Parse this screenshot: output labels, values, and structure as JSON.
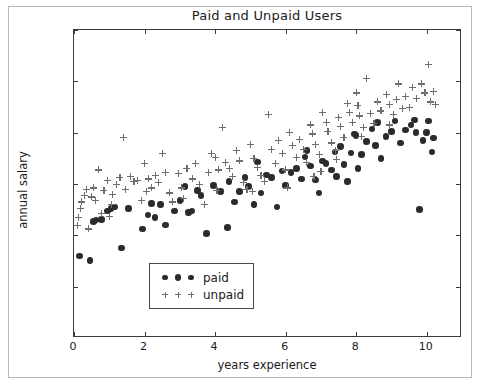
{
  "chart_data": {
    "type": "scatter",
    "title": "Paid and Unpaid Users",
    "xlabel": "years experience",
    "ylabel": "annual salary",
    "xlim": [
      0,
      11
    ],
    "ylim": [
      0,
      120000
    ],
    "xticks": [
      0,
      2,
      4,
      6,
      8,
      10
    ],
    "xtick_labels": [
      "0",
      "2",
      "4",
      "6",
      "8",
      "10"
    ],
    "yticks": [
      0,
      20000,
      40000,
      60000,
      80000,
      100000,
      120000
    ],
    "ytick_labels": [
      "0",
      "20000",
      "40000",
      "60000",
      "80000",
      "100000",
      "120000"
    ],
    "grid": false,
    "legend_position": "lower center",
    "colors": {
      "paid": "#2b2b2b",
      "unpaid": "#6e6e6e",
      "axis": "#3b3b3b",
      "background": "#ffffff",
      "frame": "#b9b9b9"
    },
    "series": [
      {
        "name": "paid",
        "marker": "circle",
        "color": "#2b2b2b",
        "points": [
          [
            0.15,
            32000
          ],
          [
            0.45,
            30200
          ],
          [
            0.55,
            45500
          ],
          [
            0.62,
            46000
          ],
          [
            0.78,
            46200
          ],
          [
            0.95,
            49500
          ],
          [
            1.05,
            50500
          ],
          [
            1.15,
            51000
          ],
          [
            1.35,
            35000
          ],
          [
            1.55,
            50500
          ],
          [
            1.95,
            42500
          ],
          [
            2.1,
            48000
          ],
          [
            2.3,
            47000
          ],
          [
            2.45,
            52000
          ],
          [
            2.6,
            44000
          ],
          [
            2.85,
            49500
          ],
          [
            3.0,
            53500
          ],
          [
            3.25,
            49000
          ],
          [
            3.35,
            49500
          ],
          [
            3.5,
            57500
          ],
          [
            3.6,
            55500
          ],
          [
            3.75,
            40800
          ],
          [
            3.95,
            59500
          ],
          [
            4.15,
            57000
          ],
          [
            4.35,
            43000
          ],
          [
            4.55,
            53000
          ],
          [
            4.7,
            57000
          ],
          [
            4.85,
            62500
          ],
          [
            4.95,
            59000
          ],
          [
            5.1,
            52000
          ],
          [
            5.3,
            56500
          ],
          [
            5.45,
            63500
          ],
          [
            5.6,
            62500
          ],
          [
            5.75,
            51000
          ],
          [
            5.9,
            65000
          ],
          [
            6.0,
            59500
          ],
          [
            6.15,
            64500
          ],
          [
            6.3,
            66000
          ],
          [
            6.45,
            62000
          ],
          [
            6.55,
            70500
          ],
          [
            6.7,
            67000
          ],
          [
            6.85,
            61500
          ],
          [
            6.95,
            56500
          ],
          [
            7.05,
            69000
          ],
          [
            7.15,
            68000
          ],
          [
            7.3,
            65500
          ],
          [
            7.45,
            63000
          ],
          [
            7.55,
            74500
          ],
          [
            7.65,
            67500
          ],
          [
            7.75,
            61000
          ],
          [
            7.85,
            72000
          ],
          [
            7.95,
            79500
          ],
          [
            8.0,
            79000
          ],
          [
            8.05,
            66000
          ],
          [
            8.15,
            71500
          ],
          [
            8.3,
            76500
          ],
          [
            8.45,
            81500
          ],
          [
            8.55,
            75000
          ],
          [
            8.7,
            70000
          ],
          [
            8.85,
            78500
          ],
          [
            9.0,
            80500
          ],
          [
            9.1,
            84500
          ],
          [
            9.25,
            76000
          ],
          [
            9.4,
            81000
          ],
          [
            9.55,
            83000
          ],
          [
            9.65,
            85000
          ],
          [
            9.8,
            50000
          ],
          [
            9.9,
            77000
          ],
          [
            10.0,
            80000
          ],
          [
            10.05,
            84500
          ],
          [
            10.15,
            72500
          ],
          [
            10.2,
            78000
          ],
          [
            5.2,
            68500
          ],
          [
            6.6,
            73000
          ],
          [
            7.4,
            72500
          ],
          [
            8.6,
            84000
          ],
          [
            9.7,
            80000
          ],
          [
            4.4,
            61000
          ],
          [
            3.15,
            59000
          ],
          [
            2.2,
            52500
          ]
        ]
      },
      {
        "name": "unpaid",
        "marker": "plus",
        "color": "#6e6e6e",
        "points": [
          [
            0.1,
            44000
          ],
          [
            0.12,
            47000
          ],
          [
            0.18,
            50500
          ],
          [
            0.22,
            53000
          ],
          [
            0.3,
            55500
          ],
          [
            0.35,
            58000
          ],
          [
            0.4,
            42500
          ],
          [
            0.5,
            55000
          ],
          [
            0.55,
            58500
          ],
          [
            0.6,
            53500
          ],
          [
            0.7,
            65500
          ],
          [
            0.78,
            48500
          ],
          [
            0.85,
            57500
          ],
          [
            0.95,
            61500
          ],
          [
            1.0,
            47500
          ],
          [
            1.1,
            56000
          ],
          [
            1.2,
            60000
          ],
          [
            1.3,
            62500
          ],
          [
            1.4,
            78000
          ],
          [
            1.45,
            58000
          ],
          [
            1.6,
            63000
          ],
          [
            1.7,
            61000
          ],
          [
            1.8,
            61500
          ],
          [
            1.9,
            53500
          ],
          [
            2.0,
            68000
          ],
          [
            2.1,
            62000
          ],
          [
            2.2,
            58500
          ],
          [
            2.3,
            63500
          ],
          [
            2.4,
            60500
          ],
          [
            2.5,
            72000
          ],
          [
            2.6,
            64500
          ],
          [
            2.7,
            56500
          ],
          [
            2.8,
            53000
          ],
          [
            2.95,
            64000
          ],
          [
            3.05,
            58500
          ],
          [
            3.2,
            66000
          ],
          [
            3.35,
            62000
          ],
          [
            3.45,
            68000
          ],
          [
            3.55,
            60000
          ],
          [
            3.7,
            52000
          ],
          [
            3.8,
            64500
          ],
          [
            3.9,
            72000
          ],
          [
            4.0,
            70500
          ],
          [
            4.1,
            65500
          ],
          [
            4.2,
            82000
          ],
          [
            4.3,
            68500
          ],
          [
            4.4,
            66000
          ],
          [
            4.5,
            63000
          ],
          [
            4.6,
            73000
          ],
          [
            4.7,
            69000
          ],
          [
            4.8,
            60500
          ],
          [
            4.9,
            58000
          ],
          [
            5.0,
            75500
          ],
          [
            5.1,
            70000
          ],
          [
            5.2,
            66500
          ],
          [
            5.3,
            63500
          ],
          [
            5.4,
            61000
          ],
          [
            5.5,
            87000
          ],
          [
            5.6,
            73500
          ],
          [
            5.7,
            68000
          ],
          [
            5.8,
            77000
          ],
          [
            5.9,
            72000
          ],
          [
            6.0,
            65500
          ],
          [
            6.1,
            80000
          ],
          [
            6.2,
            75000
          ],
          [
            6.3,
            70500
          ],
          [
            6.4,
            77500
          ],
          [
            6.5,
            73500
          ],
          [
            6.6,
            68500
          ],
          [
            6.7,
            83000
          ],
          [
            6.75,
            79500
          ],
          [
            6.85,
            75500
          ],
          [
            6.95,
            71500
          ],
          [
            7.05,
            88000
          ],
          [
            7.15,
            84000
          ],
          [
            7.2,
            80500
          ],
          [
            7.3,
            76000
          ],
          [
            7.4,
            73000
          ],
          [
            7.5,
            86000
          ],
          [
            7.55,
            82500
          ],
          [
            7.65,
            78000
          ],
          [
            7.75,
            91500
          ],
          [
            7.8,
            88000
          ],
          [
            7.9,
            84000
          ],
          [
            8.0,
            95500
          ],
          [
            8.05,
            90500
          ],
          [
            8.1,
            86500
          ],
          [
            8.2,
            82000
          ],
          [
            8.3,
            101000
          ],
          [
            8.4,
            87500
          ],
          [
            8.5,
            83500
          ],
          [
            8.6,
            92000
          ],
          [
            8.7,
            88500
          ],
          [
            8.85,
            95000
          ],
          [
            8.95,
            91000
          ],
          [
            9.05,
            87000
          ],
          [
            9.15,
            93000
          ],
          [
            9.3,
            89500
          ],
          [
            9.4,
            94000
          ],
          [
            9.5,
            90000
          ],
          [
            9.6,
            97500
          ],
          [
            9.7,
            93500
          ],
          [
            9.85,
            99000
          ],
          [
            9.95,
            95500
          ],
          [
            10.05,
            106500
          ],
          [
            10.1,
            92000
          ],
          [
            10.2,
            96000
          ],
          [
            10.25,
            91000
          ],
          [
            8.15,
            78500
          ],
          [
            7.45,
            69500
          ],
          [
            6.05,
            58500
          ],
          [
            5.05,
            57000
          ],
          [
            4.05,
            57500
          ],
          [
            3.1,
            54500
          ],
          [
            2.05,
            57000
          ],
          [
            1.05,
            52000
          ],
          [
            9.2,
            99000
          ],
          [
            8.95,
            83000
          ],
          [
            7.0,
            65000
          ],
          [
            6.8,
            63000
          ]
        ]
      }
    ]
  },
  "legend": {
    "entries": [
      {
        "label": "paid",
        "marker": "circle"
      },
      {
        "label": "unpaid",
        "marker": "plus"
      }
    ]
  }
}
